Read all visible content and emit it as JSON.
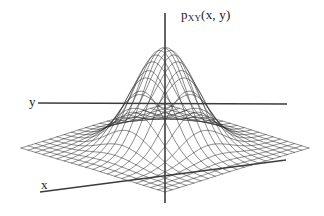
{
  "figure": {
    "title": "",
    "background_color": "#ffffff",
    "line_color": "#2b2b2b",
    "axis_color": "#3c3c3c",
    "width": 324,
    "height": 216
  },
  "labels": {
    "vertical_axis": {
      "base": "p",
      "subscript": "XY",
      "args": "(x, y)",
      "full": "pXY(x, y)"
    },
    "axis_y": "y",
    "axis_x": "x"
  },
  "chart_data": {
    "type": "surface",
    "title": "",
    "xlabel": "x",
    "ylabel": "y",
    "zlabel": "pXY(x, y)",
    "function": "exp(-(u^2 + v^2)/2)",
    "grid_lines_u": 21,
    "grid_lines_v": 21,
    "u_range": [
      -3.2,
      3.2
    ],
    "v_range": [
      -3.2,
      3.2
    ],
    "z_range": [
      0,
      1
    ],
    "grid": true,
    "legend": false,
    "projection": {
      "origin_px": [
        165,
        148
      ],
      "peak_px": [
        165,
        48
      ],
      "u_axis_px": [
        72,
        -22
      ],
      "v_axis_px": [
        72,
        22
      ],
      "z_height_px": 100
    },
    "axes": {
      "vertical": {
        "x1": 165,
        "y1": 13,
        "x2": 165,
        "y2": 203
      },
      "y_axis": {
        "x1": 38,
        "y1": 103,
        "x2": 287,
        "y2": 104
      },
      "x_axis": {
        "x1": 40,
        "y1": 192,
        "x2": 286,
        "y2": 160
      }
    }
  }
}
